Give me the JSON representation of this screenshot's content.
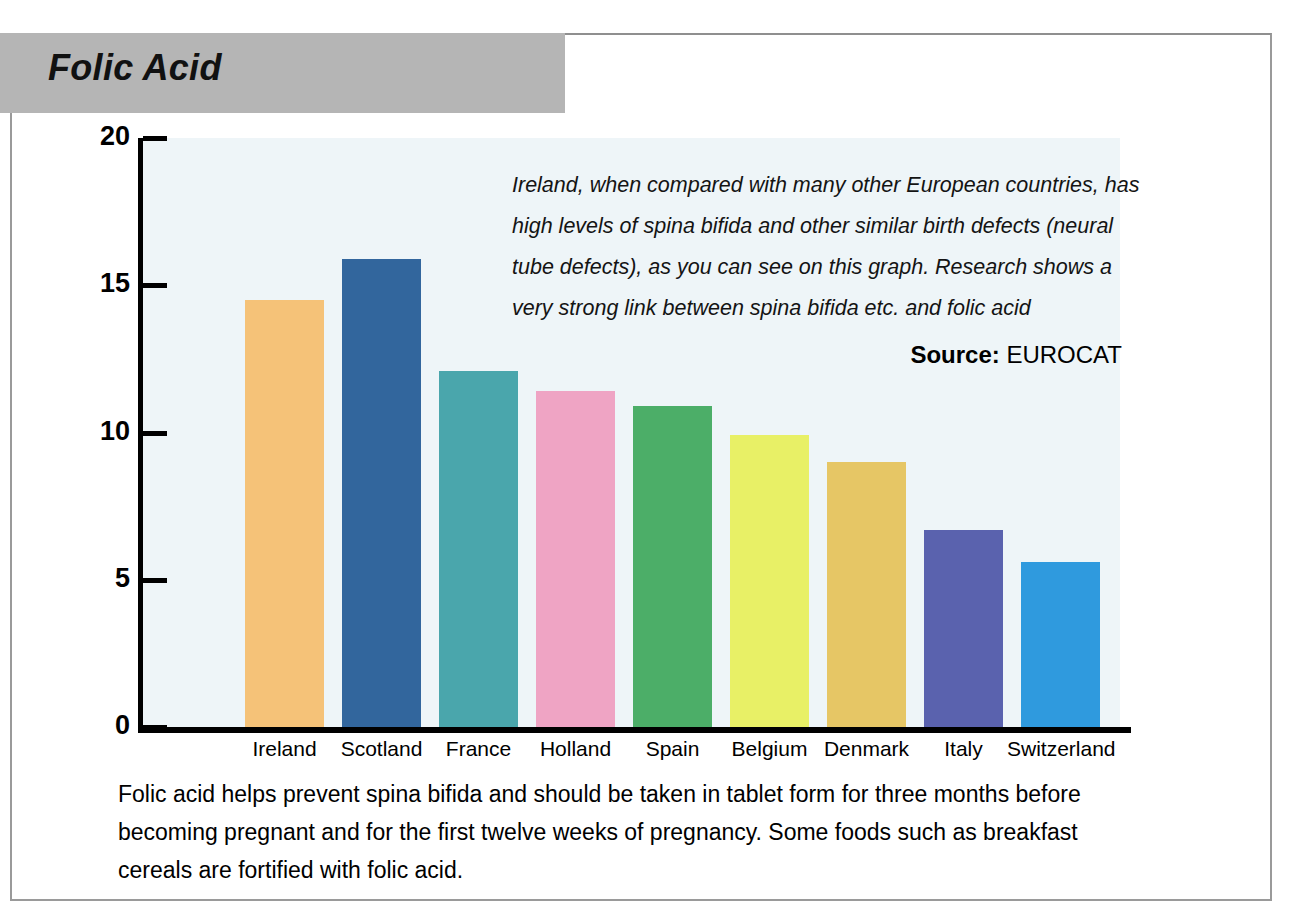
{
  "page": {
    "title": "Folic Acid"
  },
  "annotation": {
    "lines": [
      "Ireland, when compared with many other European countries, has",
      "high levels of spina bifida and other similar birth defects (neural",
      "tube defects), as you can see on this graph. Research shows a",
      "very strong link between spina bifida etc. and folic acid"
    ],
    "source_label": "Source:",
    "source_value": "EUROCAT"
  },
  "caption": {
    "lines": [
      "Folic acid helps prevent spina bifida and should be taken in tablet form for three months before",
      "becoming pregnant and for the first twelve weeks of pregnancy. Some foods such as breakfast",
      "cereals are fortified with folic acid."
    ]
  },
  "chart_data": {
    "type": "bar",
    "title": "Folic Acid",
    "xlabel": "",
    "ylabel": "",
    "ylim": [
      0,
      20
    ],
    "yticks": [
      0,
      5,
      10,
      15,
      20
    ],
    "ytick_labels": [
      "0",
      "5",
      "10",
      "15",
      "20"
    ],
    "grid": false,
    "legend": null,
    "categories": [
      "Ireland",
      "Scotland",
      "France",
      "Holland",
      "Spain",
      "Belgium",
      "Denmark",
      "Italy",
      "Switzerland"
    ],
    "values": [
      14.5,
      15.9,
      12.1,
      11.4,
      10.9,
      9.9,
      9.0,
      6.7,
      5.6
    ],
    "colors": [
      "#f5c278",
      "#32669d",
      "#4aa6ac",
      "#efa4c4",
      "#4cae68",
      "#e8f066",
      "#e6c665",
      "#5a62ae",
      "#2f9ade"
    ],
    "annotations": [
      "Ireland, when compared with many other European countries, has high levels of spina bifida and other similar birth defects (neural tube defects), as you can see on this graph. Research shows a very strong link between spina bifida etc. and folic acid",
      "Source: EUROCAT"
    ]
  }
}
